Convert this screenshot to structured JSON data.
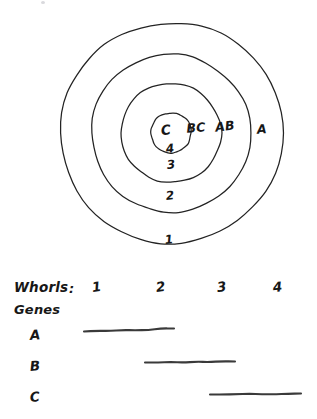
{
  "figure": {
    "style": "hand-drawn pen sketch on white paper",
    "ink_color": "#232323",
    "paper_color": "#ffffff"
  },
  "diagram": {
    "type": "concentric-rings",
    "center": {
      "x": 171,
      "y": 133
    },
    "rings": [
      {
        "id": "ring-1",
        "whorl_number": "1",
        "radius": 111,
        "number_label": "1",
        "number_pos": {
          "x": 169,
          "y": 240
        }
      },
      {
        "id": "ring-2",
        "whorl_number": "2",
        "radius": 79,
        "number_label": "2",
        "number_pos": {
          "x": 170,
          "y": 196
        }
      },
      {
        "id": "ring-3",
        "whorl_number": "3",
        "radius": 50,
        "number_label": "3",
        "number_pos": {
          "x": 171,
          "y": 165
        }
      },
      {
        "id": "ring-4",
        "whorl_number": "4",
        "radius": 20,
        "number_label": "4",
        "number_pos": {
          "x": 170,
          "y": 149
        }
      }
    ],
    "gene_domain_labels": [
      {
        "id": "domain-c",
        "text": "C",
        "x": 166,
        "y": 131
      },
      {
        "id": "domain-bc",
        "text": "BC",
        "x": 196,
        "y": 129
      },
      {
        "id": "domain-ab",
        "text": "AB",
        "x": 225,
        "y": 128
      },
      {
        "id": "domain-a",
        "text": "A",
        "x": 262,
        "y": 130
      }
    ]
  },
  "legend": {
    "whorls_label": "Whorls",
    "colon": ":",
    "whorl_numbers": [
      {
        "label": "1",
        "x": 92
      },
      {
        "label": "2",
        "x": 156
      },
      {
        "label": "3",
        "x": 217
      },
      {
        "label": "4",
        "x": 273
      }
    ],
    "genes_label": "Genes",
    "gene_rows": [
      {
        "letter": "A",
        "bar_start_x": 84,
        "bar_end_x": 174,
        "bar_y": 330,
        "label_y": 329,
        "whorls_covered": "1-2"
      },
      {
        "letter": "B",
        "bar_start_x": 145,
        "bar_end_x": 235,
        "bar_y": 362,
        "label_y": 360,
        "whorls_covered": "2-3"
      },
      {
        "letter": "C",
        "bar_start_x": 210,
        "bar_end_x": 301,
        "bar_y": 394,
        "label_y": 391,
        "whorls_covered": "3-4"
      }
    ]
  }
}
